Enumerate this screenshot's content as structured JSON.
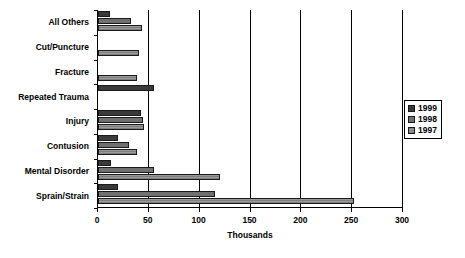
{
  "chart_data": {
    "type": "bar",
    "orientation": "horizontal",
    "title": "",
    "subtitle": "",
    "xlabel": "Thousands",
    "ylabel": "",
    "xlim": [
      0,
      300
    ],
    "ylim": null,
    "xticks": [
      0,
      50,
      100,
      150,
      200,
      250,
      300
    ],
    "xticklabels": [
      "0",
      "50",
      "100",
      "150",
      "200",
      "250",
      "300"
    ],
    "grid": "vertical",
    "legend_position": "right",
    "categories": [
      "All Others",
      "Cut/Puncture",
      "Fracture",
      "Repeated Trauma",
      "Injury",
      "Contusion",
      "Mental Disorder",
      "Sprain/Strain"
    ],
    "series": [
      {
        "name": "1999",
        "color": "#3a3a3a",
        "values": [
          12,
          0,
          0,
          55,
          42,
          20,
          13,
          20
        ]
      },
      {
        "name": "1998",
        "color": "#707070",
        "values": [
          32,
          0,
          0,
          0,
          44,
          30,
          55,
          115
        ]
      },
      {
        "name": "1997",
        "color": "#9a9a9a",
        "values": [
          43,
          40,
          38,
          0,
          45,
          38,
          120,
          252
        ]
      }
    ],
    "legend": [
      "1999",
      "1998",
      "1997"
    ],
    "annotations": []
  },
  "axis": {
    "x_title": "Thousands"
  },
  "colors": {
    "series_1999": "#3a3a3a",
    "series_1998": "#707070",
    "series_1997": "#9a9a9a",
    "axis": "#000000",
    "background": "#ffffff"
  }
}
